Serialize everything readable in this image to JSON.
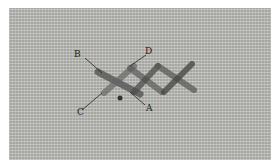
{
  "image": {
    "description": "Close-up photo of cross stitches on woven fabric with labeled points",
    "background_color": "#b9b9b6",
    "thread_color": "#4a4a4a"
  },
  "labels": {
    "a": "A",
    "b": "B",
    "c": "C",
    "d": "D"
  }
}
